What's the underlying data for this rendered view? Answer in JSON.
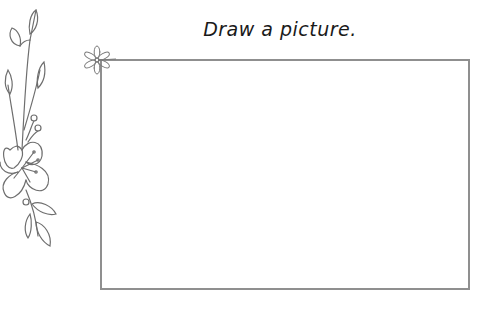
{
  "worksheet": {
    "title": "Draw a picture.",
    "drawing_area": {
      "border_color": "#8f8f8f"
    },
    "decorations": {
      "side_floral": "floral-vine-illustration",
      "corner_flower": "small-daisy-icon"
    }
  }
}
